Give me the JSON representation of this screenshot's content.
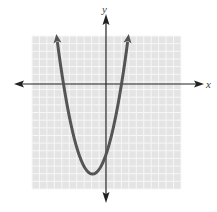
{
  "chart_data": {
    "type": "line",
    "title": "",
    "xlabel": "x",
    "ylabel": "y",
    "xlim": [
      -10,
      10
    ],
    "ylim": [
      -14,
      6
    ],
    "grid": true,
    "grid_step": 1,
    "equation": "y = 0.75(x + 6)(x - 2)",
    "series": [
      {
        "name": "parabola",
        "x": [
          -7,
          -6,
          -5,
          -4,
          -3,
          -2,
          -1,
          0,
          1,
          2,
          3
        ],
        "y": [
          6.75,
          0,
          -5.25,
          -9,
          -11.25,
          -12,
          -11.25,
          -9,
          -5.25,
          0,
          6.75
        ]
      }
    ],
    "roots": [
      -6,
      2
    ],
    "vertex": [
      -2,
      -12
    ],
    "y_intercept": -9,
    "colors": {
      "curve": "#555555",
      "axes": "#222222",
      "grid_bg": "#e4e4e4",
      "grid_line": "#f6f6f6"
    }
  },
  "labels": {
    "x_axis": "x",
    "y_axis": "y"
  }
}
